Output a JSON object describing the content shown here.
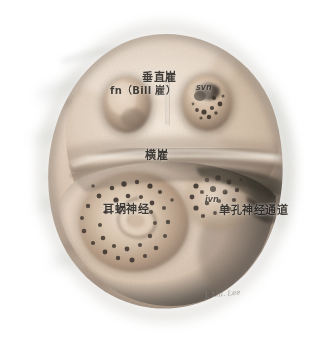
{
  "figure": {
    "medium": "medical illustration",
    "frame_color": "#d9dcda",
    "background_color": "#ffffff"
  },
  "palette": {
    "halo_outer": "#ffffff",
    "halo_mid": "#c9cdc6",
    "halo_inner": "#9aa29a",
    "tissue_light": "#efe3d6",
    "tissue_mid": "#d9c6b4",
    "tissue_shadow": "#8f7f72",
    "tissue_deep": "#5b5048",
    "pore_dark": "#3a322c",
    "crest_highlight": "#f6eee4",
    "label_text": "#2a2724",
    "signature_text": "#8d8880"
  },
  "labels": {
    "vertical_crest": "垂直嵟",
    "bill_bar": "fn（Bill 嵟）",
    "svn": "svn",
    "transverse_crest": "横嵟",
    "cochlear_nerve": "耳蜗神经",
    "ivn": "ivn",
    "singular_canal": "单孔神经通道"
  },
  "signature": {
    "text": "J. Liu. Lee"
  },
  "structures": [
    {
      "id": "superior-compartment",
      "name": "上区 (superior compartment)",
      "contains": [
        "facial-nerve-fossa",
        "superior-vestibular-area"
      ]
    },
    {
      "id": "facial-nerve-fossa",
      "name": "面神经管口 (facial nerve canal)",
      "abbr": "fn",
      "pores": 0
    },
    {
      "id": "superior-vestibular-area",
      "name": "前庭上区 (superior vestibular area)",
      "abbr": "svn",
      "pores": 10
    },
    {
      "id": "transverse-crest",
      "name": "横嵟 (transverse crest / falciform crest)"
    },
    {
      "id": "vertical-crest",
      "name": "垂直嵟 (vertical crest / Bill's bar)"
    },
    {
      "id": "cochlear-area",
      "name": "蜗区 / 螺旋孔板 (tractus spiralis foraminosus)",
      "abbr": "cn",
      "pores": 34
    },
    {
      "id": "inferior-vestibular-area",
      "name": "前庭下区 (inferior vestibular area)",
      "abbr": "ivn",
      "pores": 17
    },
    {
      "id": "singular-canal",
      "name": "单孔神经通道 (singular canal)",
      "pores": 1
    }
  ]
}
